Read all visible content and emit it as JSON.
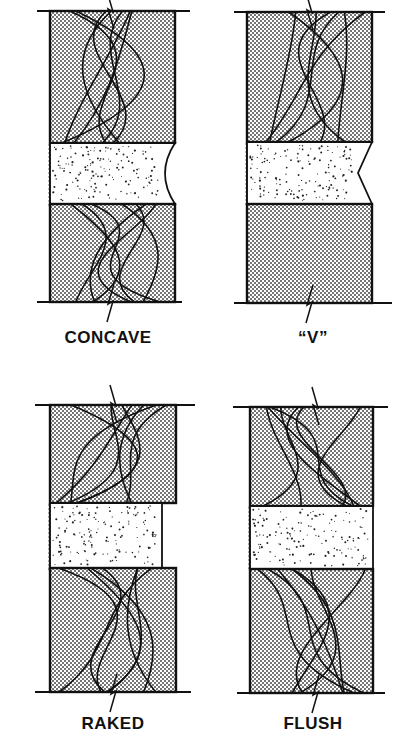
{
  "figure": {
    "colors": {
      "ink": "#111111",
      "background": "#ffffff",
      "brick_stipple": "#3a3a3a",
      "mortar_speckle": "#222222"
    },
    "panels": [
      {
        "id": "concave",
        "label": "CONCAVE",
        "joint_profile": "concave",
        "label_x": 108,
        "label_y": 328,
        "wall_line": {
          "x1": 37,
          "x2": 190,
          "top_y": 11,
          "bottom_y": 302,
          "bottom_x1": 37,
          "bottom_x2": 182
        },
        "brick": {
          "x": 50,
          "w": 125
        },
        "top_brick": {
          "y": 11,
          "h": 132
        },
        "mortar": {
          "y": 143,
          "h": 61,
          "recess": 10
        },
        "bottom_brick": {
          "y": 204,
          "h": 98
        },
        "break_x": 110
      },
      {
        "id": "v",
        "label": "“V”",
        "joint_profile": "v",
        "label_x": 313,
        "label_y": 328,
        "wall_line": {
          "x1": 234,
          "x2": 385,
          "top_y": 12,
          "bottom_y": 303,
          "bottom_x1": 234,
          "bottom_x2": 392
        },
        "brick": {
          "x": 247,
          "w": 125
        },
        "top_brick": {
          "y": 12,
          "h": 130
        },
        "mortar": {
          "y": 142,
          "h": 62,
          "recess": 14
        },
        "bottom_brick": {
          "y": 204,
          "h": 99
        },
        "break_x": 309
      },
      {
        "id": "raked",
        "label": "RAKED",
        "joint_profile": "raked",
        "label_x": 113,
        "label_y": 714,
        "wall_line": {
          "x1": 35,
          "x2": 195,
          "top_y": 405,
          "bottom_y": 692,
          "bottom_x1": 35,
          "bottom_x2": 191
        },
        "brick": {
          "x": 50,
          "w": 126
        },
        "top_brick": {
          "y": 405,
          "h": 98
        },
        "mortar": {
          "y": 503,
          "h": 65,
          "recess": 14
        },
        "bottom_brick": {
          "y": 568,
          "h": 124
        },
        "break_x": 113
      },
      {
        "id": "flush",
        "label": "FLUSH",
        "joint_profile": "flush",
        "label_x": 313,
        "label_y": 714,
        "wall_line": {
          "x1": 233,
          "x2": 388,
          "top_y": 407,
          "bottom_y": 693,
          "bottom_x1": 237,
          "bottom_x2": 385
        },
        "brick": {
          "x": 250,
          "w": 123
        },
        "top_brick": {
          "y": 407,
          "h": 99
        },
        "mortar": {
          "y": 506,
          "h": 63,
          "recess": 0
        },
        "bottom_brick": {
          "y": 569,
          "h": 124
        },
        "break_x": 315
      }
    ]
  }
}
